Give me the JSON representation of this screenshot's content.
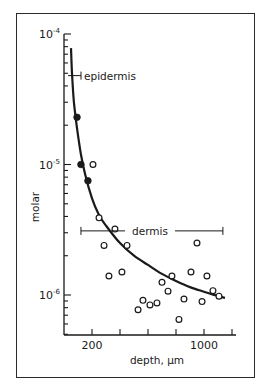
{
  "chart_data": {
    "type": "scatter",
    "title": "",
    "xlabel": "depth, µm",
    "ylabel": "molar",
    "x_scale": "linear",
    "y_scale": "log",
    "xlim": [
      0,
      1215
    ],
    "ylim": [
      5e-07,
      0.0001
    ],
    "x_ticks": [
      200,
      400,
      600,
      800,
      1000,
      1200
    ],
    "x_tick_labels": [
      "200",
      "",
      "",
      "",
      "1000",
      ""
    ],
    "y_ticks": [
      0.0001,
      1e-05,
      1e-06
    ],
    "y_tick_labels": [
      {
        "base": "10",
        "exp": "-4"
      },
      {
        "base": "10",
        "exp": "-5"
      },
      {
        "base": "10",
        "exp": "-6"
      }
    ],
    "grid": false,
    "legend": null,
    "series": [
      {
        "name": "epidermis",
        "marker": "filled-circle",
        "points": [
          {
            "x": 93,
            "y": 2.3e-05
          },
          {
            "x": 121,
            "y": 1e-05
          },
          {
            "x": 171,
            "y": 7.5e-06
          }
        ]
      },
      {
        "name": "dermis",
        "marker": "open-circle",
        "points": [
          {
            "x": 207,
            "y": 1e-05
          },
          {
            "x": 250,
            "y": 3.9e-06
          },
          {
            "x": 364,
            "y": 3.2e-06
          },
          {
            "x": 286,
            "y": 2.4e-06
          },
          {
            "x": 450,
            "y": 2.4e-06
          },
          {
            "x": 414,
            "y": 1.5e-06
          },
          {
            "x": 321,
            "y": 1.4e-06
          },
          {
            "x": 950,
            "y": 2.5e-06
          },
          {
            "x": 771,
            "y": 1.4e-06
          },
          {
            "x": 907,
            "y": 1.5e-06
          },
          {
            "x": 1021,
            "y": 1.4e-06
          },
          {
            "x": 700,
            "y": 1.25e-06
          },
          {
            "x": 743,
            "y": 1.07e-06
          },
          {
            "x": 1064,
            "y": 1.08e-06
          },
          {
            "x": 1107,
            "y": 9.8e-07
          },
          {
            "x": 857,
            "y": 9.3e-07
          },
          {
            "x": 986,
            "y": 8.9e-07
          },
          {
            "x": 564,
            "y": 9.1e-07
          },
          {
            "x": 614,
            "y": 8.4e-07
          },
          {
            "x": 664,
            "y": 8.7e-07
          },
          {
            "x": 529,
            "y": 7.7e-07
          },
          {
            "x": 821,
            "y": 6.5e-07
          }
        ]
      },
      {
        "name": "fitted-curve",
        "marker": "line",
        "points": [
          {
            "x": 50,
            "y": 7.8e-05
          },
          {
            "x": 57,
            "y": 5e-05
          },
          {
            "x": 71,
            "y": 3e-05
          },
          {
            "x": 93,
            "y": 1.9e-05
          },
          {
            "x": 121,
            "y": 1.2e-05
          },
          {
            "x": 150,
            "y": 8.5e-06
          },
          {
            "x": 200,
            "y": 5.5e-06
          },
          {
            "x": 250,
            "y": 4.1e-06
          },
          {
            "x": 300,
            "y": 3.4e-06
          },
          {
            "x": 400,
            "y": 2.5e-06
          },
          {
            "x": 500,
            "y": 2e-06
          },
          {
            "x": 600,
            "y": 1.7e-06
          },
          {
            "x": 700,
            "y": 1.45e-06
          },
          {
            "x": 800,
            "y": 1.28e-06
          },
          {
            "x": 900,
            "y": 1.15e-06
          },
          {
            "x": 1000,
            "y": 1.06e-06
          },
          {
            "x": 1100,
            "y": 9.8e-07
          },
          {
            "x": 1150,
            "y": 9.5e-07
          }
        ]
      }
    ],
    "annotations": [
      {
        "text": "epidermis",
        "range_x": [
          64,
          121
        ],
        "y": 4.8e-05,
        "bar_start_x": 64
      },
      {
        "text": "dermis",
        "range_x": [
          171,
          1135
        ],
        "y": 3.1e-06
      }
    ]
  }
}
